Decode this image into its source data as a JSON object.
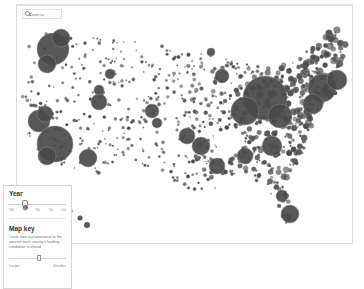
{
  "map": {
    "search": {
      "placeholder": "Zoom to"
    },
    "colors": {
      "fill": "#4a4a4a",
      "stroke": "#8d8d8d",
      "frame_border": "#dcdcdc"
    },
    "major_circles": [
      {
        "x": 36,
        "y": 43,
        "r": 16
      },
      {
        "x": 30,
        "y": 58,
        "r": 9
      },
      {
        "x": 44,
        "y": 32,
        "r": 9
      },
      {
        "x": 22,
        "y": 115,
        "r": 11
      },
      {
        "x": 28,
        "y": 108,
        "r": 8
      },
      {
        "x": 38,
        "y": 138,
        "r": 18
      },
      {
        "x": 30,
        "y": 150,
        "r": 9
      },
      {
        "x": 71,
        "y": 152,
        "r": 9
      },
      {
        "x": 82,
        "y": 96,
        "r": 8
      },
      {
        "x": 82,
        "y": 84,
        "r": 5
      },
      {
        "x": 93,
        "y": 68,
        "r": 5
      },
      {
        "x": 135,
        "y": 105,
        "r": 7
      },
      {
        "x": 140,
        "y": 117,
        "r": 5
      },
      {
        "x": 205,
        "y": 70,
        "r": 7
      },
      {
        "x": 194,
        "y": 46,
        "r": 4
      },
      {
        "x": 248,
        "y": 92,
        "r": 22
      },
      {
        "x": 228,
        "y": 105,
        "r": 14
      },
      {
        "x": 263,
        "y": 110,
        "r": 12
      },
      {
        "x": 305,
        "y": 82,
        "r": 14
      },
      {
        "x": 320,
        "y": 74,
        "r": 10
      },
      {
        "x": 296,
        "y": 98,
        "r": 10
      },
      {
        "x": 255,
        "y": 140,
        "r": 10
      },
      {
        "x": 228,
        "y": 150,
        "r": 8
      },
      {
        "x": 200,
        "y": 160,
        "r": 8
      },
      {
        "x": 184,
        "y": 140,
        "r": 9
      },
      {
        "x": 170,
        "y": 130,
        "r": 8
      },
      {
        "x": 273,
        "y": 208,
        "r": 9
      },
      {
        "x": 265,
        "y": 190,
        "r": 6
      },
      {
        "x": 42,
        "y": 200,
        "r": 2.5
      },
      {
        "x": 53,
        "y": 205,
        "r": 2.5
      },
      {
        "x": 63,
        "y": 212,
        "r": 2.5
      },
      {
        "x": 70,
        "y": 219,
        "r": 3
      }
    ]
  },
  "side_panel": {
    "year": {
      "title": "Year",
      "ticks": [
        "'88",
        "'92",
        "'96",
        "'00",
        "'04"
      ],
      "selected_index": 1
    },
    "map_key": {
      "title": "Map key",
      "description": "Circle size is proportional to the amount each county's leading candidate is ahead",
      "size_slider": {
        "min_label": "Larger",
        "max_label": "Smaller",
        "position_pct": 52
      }
    }
  }
}
